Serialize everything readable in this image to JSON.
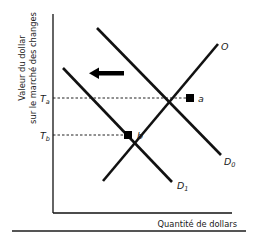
{
  "diagram": {
    "y_axis_label_line1": "Valeur du dollar",
    "y_axis_label_line2": "sur le marché des changes",
    "x_axis_label": "Quantité de dollars",
    "curves": {
      "supply": "O",
      "demand_initial": "D",
      "demand_initial_sub": "0",
      "demand_new": "D",
      "demand_new_sub": "1"
    },
    "points": {
      "a": "a",
      "b": "b"
    },
    "levels": {
      "Ta": "T",
      "Ta_sub": "a",
      "Tb": "T",
      "Tb_sub": "b"
    },
    "shift_arrow": "left",
    "colors": {
      "line": "#111111",
      "text": "#1a1a1a",
      "axis_text": "#333333"
    }
  }
}
